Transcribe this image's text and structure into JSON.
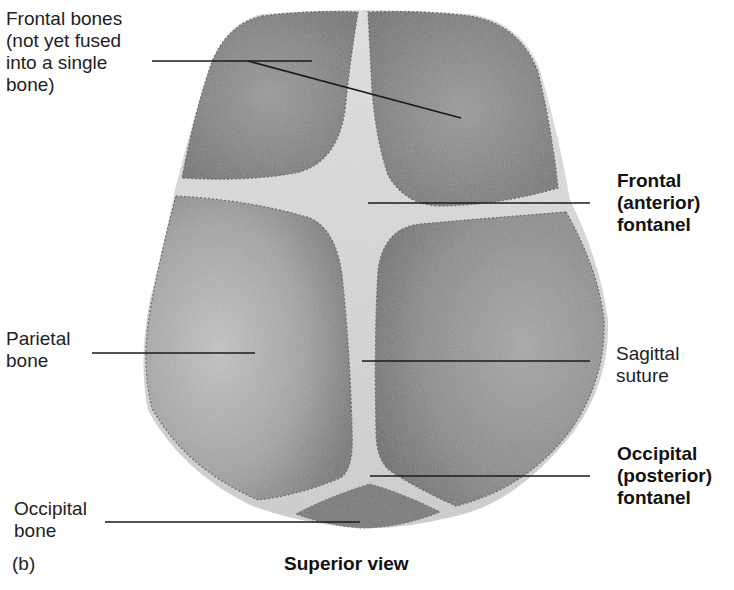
{
  "figure": {
    "panel_letter": "(b)",
    "caption": "Superior view",
    "colors": {
      "bone_dark": "#6e6e6e",
      "bone_mid": "#8f8f8f",
      "bone_light": "#b9b9b9",
      "fontanel": "#e6e6e6",
      "suture": "#d8d8d8",
      "leader_line": "#1a1a1a",
      "background": "#ffffff"
    }
  },
  "labels": {
    "frontal_bones": "Frontal bones\n(not yet fused\ninto a single\nbone)",
    "frontal_fontanel": "Frontal\n(anterior)\nfontanel",
    "parietal_bone": "Parietal\nbone",
    "sagittal_suture": "Sagittal\nsuture",
    "occipital_fontanel": "Occipital\n(posterior)\nfontanel",
    "occipital_bone": "Occipital\nbone"
  }
}
